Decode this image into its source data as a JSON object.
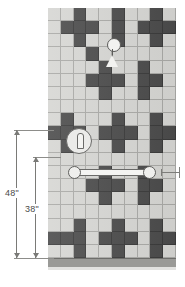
{
  "drawing": {
    "title": "Shower wall tile elevation",
    "tile_colors": {
      "light": "#d6d6d3",
      "dark": "#4b4b4b",
      "grout": "#a9a9a6",
      "floor": "#9a9a97",
      "dimension_line": "#7a7a77",
      "dimension_text": "#4a4a48"
    },
    "grid": {
      "columns": 10,
      "rows": 19,
      "tile_px": 12.8,
      "origin_x": 48,
      "origin_y": 8,
      "width": 128,
      "height": 250
    },
    "dark_tiles": [
      [
        0,
        2
      ],
      [
        0,
        5
      ],
      [
        0,
        8
      ],
      [
        1,
        1
      ],
      [
        1,
        2
      ],
      [
        1,
        3
      ],
      [
        1,
        5
      ],
      [
        1,
        7
      ],
      [
        1,
        8
      ],
      [
        1,
        9
      ],
      [
        2,
        2
      ],
      [
        2,
        5
      ],
      [
        2,
        8
      ],
      [
        4,
        4
      ],
      [
        4,
        7
      ],
      [
        3,
        3
      ],
      [
        5,
        3
      ],
      [
        5,
        4
      ],
      [
        5,
        5
      ],
      [
        5,
        7
      ],
      [
        5,
        8
      ],
      [
        6,
        4
      ],
      [
        6,
        7
      ],
      [
        8,
        1
      ],
      [
        8,
        5
      ],
      [
        8,
        8
      ],
      [
        9,
        0
      ],
      [
        9,
        1
      ],
      [
        9,
        2
      ],
      [
        9,
        4
      ],
      [
        9,
        5
      ],
      [
        9,
        6
      ],
      [
        9,
        8
      ],
      [
        9,
        9
      ],
      [
        10,
        1
      ],
      [
        10,
        5
      ],
      [
        10,
        8
      ],
      [
        12,
        4
      ],
      [
        12,
        7
      ],
      [
        13,
        3
      ],
      [
        13,
        4
      ],
      [
        13,
        5
      ],
      [
        13,
        7
      ],
      [
        13,
        8
      ],
      [
        14,
        4
      ],
      [
        14,
        7
      ],
      [
        16,
        2
      ],
      [
        16,
        5
      ],
      [
        16,
        8
      ],
      [
        17,
        0
      ],
      [
        17,
        1
      ],
      [
        17,
        2
      ],
      [
        17,
        4
      ],
      [
        17,
        5
      ],
      [
        17,
        6
      ],
      [
        17,
        8
      ],
      [
        17,
        9
      ],
      [
        18,
        2
      ],
      [
        18,
        5
      ],
      [
        18,
        8
      ]
    ],
    "fixtures": [
      {
        "name": "showerhead",
        "label": "showerhead"
      },
      {
        "name": "shower-valve",
        "label": "valve"
      },
      {
        "name": "grab-bar",
        "label": "grab bar"
      }
    ],
    "dimensions": [
      {
        "name": "overall-height",
        "label": "48\"",
        "value": 48,
        "unit": "in"
      },
      {
        "name": "grab-bar-height",
        "label": "38\"",
        "value": 38,
        "unit": "in"
      }
    ]
  }
}
